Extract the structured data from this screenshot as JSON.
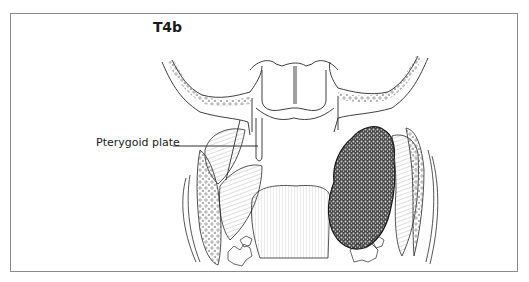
{
  "figure": {
    "title": "T4b",
    "labels": [
      {
        "text": "Pterygoid plate",
        "target": "pterygoid-plate"
      }
    ],
    "colors": {
      "frame_border": "#8a8a8a",
      "line": "#2a2a2a",
      "tumor_fill": "#3a3a3a",
      "background": "#ffffff"
    }
  }
}
